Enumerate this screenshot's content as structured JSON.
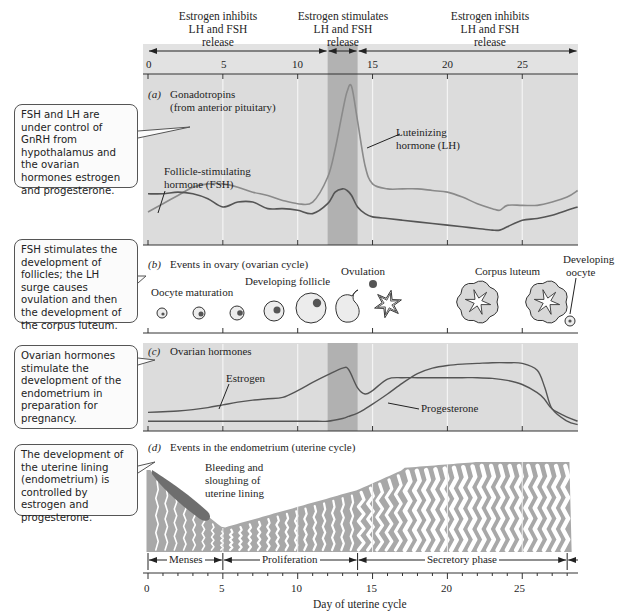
{
  "header": {
    "phases": [
      {
        "text": [
          "Estrogen inhibits",
          "LH and FSH",
          "release"
        ],
        "days": [
          0,
          12
        ]
      },
      {
        "text": [
          "Estrogen stimulates",
          "LH and FSH",
          "release"
        ],
        "days": [
          12,
          14
        ]
      },
      {
        "text": [
          "Estrogen inhibits",
          "LH and FSH",
          "release"
        ],
        "days": [
          14,
          28.7
        ]
      }
    ],
    "top_ticks": [
      "0",
      "5",
      "10",
      "15",
      "20",
      "25"
    ]
  },
  "callouts": [
    {
      "id": "gonadotropins",
      "text": "FSH and LH are under control of GnRH from hypothalamus and  the ovarian hormones estrogen and progesterone."
    },
    {
      "id": "ovary",
      "text": "FSH stimulates the development of follicles; the LH surge causes ovulation and then the development of the corpus luteum."
    },
    {
      "id": "ovarian-hormones",
      "text": "Ovarian hormones stimulate the development of the endometrium in preparation for pregnancy."
    },
    {
      "id": "endometrium",
      "text": "The development of the uterine lining (endometrium) is controlled by estrogen and progesterone."
    }
  ],
  "panel_a": {
    "letter": "(a)",
    "title": [
      "Gonadotropins",
      "(from anterior pituitary)"
    ],
    "lh_label": [
      "Luteinizing",
      "hormone (LH)"
    ],
    "fsh_label": [
      "Follicle-stimulating",
      "hormone (FSH)"
    ]
  },
  "panel_b": {
    "letter": "(b)",
    "title": "Events in ovary (ovarian cycle)",
    "labels": {
      "oocyte_maturation": "Oocyte maturation",
      "developing_follicle": "Developing follicle",
      "ovulation": "Ovulation",
      "corpus_luteum": "Corpus luteum",
      "developing_oocyte": [
        "Developing",
        "oocyte"
      ]
    }
  },
  "panel_c": {
    "letter": "(c)",
    "title": "Ovarian hormones",
    "estrogen_label": "Estrogen",
    "progesterone_label": "Progesterone"
  },
  "panel_d": {
    "letter": "(d)",
    "title": "Events in the endometrium (uterine cycle)",
    "bleeding_label": [
      "Bleeding and",
      "sloughing of",
      "uterine lining"
    ],
    "phases": [
      {
        "label": "Menses",
        "days": [
          0,
          5
        ]
      },
      {
        "label": "Proliferation",
        "days": [
          5,
          14
        ]
      },
      {
        "label": "Secretory phase",
        "days": [
          14,
          28
        ]
      }
    ]
  },
  "x_axis": {
    "label": "Day of uterine cycle",
    "ticks": [
      "0",
      "5",
      "10",
      "15",
      "20",
      "25"
    ],
    "range": [
      0,
      28.7
    ],
    "surge_band_days": [
      12,
      14
    ]
  },
  "chart_data": [
    {
      "type": "line",
      "title": "(a) Gonadotropins (from anterior pituitary)",
      "xlabel": "Day of uterine cycle",
      "ylabel": "",
      "xlim": [
        0,
        28.7
      ],
      "ylim": [
        0,
        1
      ],
      "x": [
        0,
        1,
        2,
        3,
        4,
        5,
        6,
        7,
        8,
        9,
        10,
        11,
        12,
        12.5,
        13,
        13.3,
        13.6,
        14,
        14.5,
        15,
        16,
        17,
        18,
        19,
        20,
        21,
        22,
        23,
        23.5,
        24,
        25,
        26,
        27,
        28,
        28.7
      ],
      "series": [
        {
          "name": "Luteinizing hormone (LH)",
          "color": "#8a8a8a",
          "values": [
            0.17,
            0.22,
            0.27,
            0.32,
            0.34,
            0.34,
            0.32,
            0.29,
            0.27,
            0.24,
            0.22,
            0.23,
            0.38,
            0.55,
            0.78,
            0.9,
            0.93,
            0.72,
            0.45,
            0.34,
            0.31,
            0.31,
            0.31,
            0.3,
            0.29,
            0.26,
            0.22,
            0.19,
            0.18,
            0.21,
            0.21,
            0.21,
            0.23,
            0.26,
            0.3
          ]
        },
        {
          "name": "Follicle-stimulating hormone (FSH)",
          "color": "#555555",
          "values": [
            0.28,
            0.28,
            0.29,
            0.28,
            0.25,
            0.2,
            0.23,
            0.23,
            0.19,
            0.19,
            0.18,
            0.16,
            0.22,
            0.29,
            0.31,
            0.3,
            0.27,
            0.2,
            0.16,
            0.14,
            0.13,
            0.12,
            0.11,
            0.1,
            0.09,
            0.08,
            0.07,
            0.06,
            0.06,
            0.08,
            0.12,
            0.13,
            0.15,
            0.18,
            0.2
          ]
        }
      ],
      "annotations": [
        "Luteinizing hormone (LH)",
        "Follicle-stimulating hormone (FSH)"
      ],
      "grid": true
    },
    {
      "type": "line",
      "title": "(c) Ovarian hormones",
      "xlabel": "Day of uterine cycle",
      "ylabel": "",
      "xlim": [
        0,
        28.7
      ],
      "ylim": [
        0,
        1
      ],
      "x": [
        0,
        1,
        2,
        3,
        4,
        5,
        6,
        7,
        8,
        9,
        10,
        11,
        12,
        13,
        13.4,
        14,
        14.5,
        15,
        16,
        17,
        18,
        19,
        20,
        21,
        22,
        23,
        24,
        25,
        26,
        26.5,
        27,
        28,
        28.7
      ],
      "series": [
        {
          "name": "Estrogen",
          "color": "#555555",
          "values": [
            0.23,
            0.24,
            0.25,
            0.27,
            0.3,
            0.34,
            0.38,
            0.41,
            0.43,
            0.45,
            0.55,
            0.67,
            0.78,
            0.88,
            0.86,
            0.59,
            0.5,
            0.55,
            0.72,
            0.74,
            0.74,
            0.74,
            0.74,
            0.74,
            0.74,
            0.73,
            0.7,
            0.64,
            0.52,
            0.42,
            0.28,
            0.16,
            0.1
          ]
        },
        {
          "name": "Progesterone",
          "color": "#555555",
          "values": [
            0.1,
            0.1,
            0.1,
            0.1,
            0.1,
            0.1,
            0.1,
            0.1,
            0.1,
            0.1,
            0.1,
            0.1,
            0.1,
            0.14,
            0.17,
            0.22,
            0.28,
            0.35,
            0.5,
            0.66,
            0.8,
            0.88,
            0.92,
            0.94,
            0.95,
            0.96,
            0.96,
            0.95,
            0.85,
            0.6,
            0.28,
            0.1,
            0.05
          ]
        }
      ],
      "annotations": [
        "Estrogen",
        "Progesterone"
      ],
      "grid": true
    }
  ]
}
